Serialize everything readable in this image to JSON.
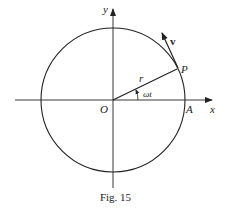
{
  "figure": {
    "caption": "Fig. 15",
    "labels": {
      "y_axis": "y",
      "x_axis": "x",
      "origin": "O",
      "point_a": "A",
      "point_p": "P",
      "radius": "r",
      "angle": "ωt",
      "velocity": "v"
    },
    "geometry": {
      "center": [
        113,
        100
      ],
      "radius": 72,
      "angle_deg": 27
    },
    "colors": {
      "stroke": "#222222",
      "background": "#ffffff"
    }
  }
}
